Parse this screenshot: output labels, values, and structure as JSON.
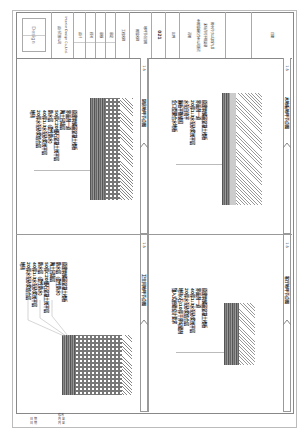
{
  "title_block": {
    "logo_text": "Design",
    "company_lines": [
      "设计有限公司",
      "Interior Design Co.,Ltd."
    ],
    "project_label": "工程名称",
    "drawing_label": "图纸名称",
    "drawing_name": "地坪节点详图",
    "drawing_no_label": "图纸编号",
    "drawing_no": "021",
    "scale_label": "比例",
    "notes_label": "说明",
    "notes": [
      "本图纸版权归本公司所有",
      "未经许可不得复制",
      "图中尺寸以现场为准"
    ],
    "approvals": [
      "设计",
      "校对",
      "审核",
      "审定"
    ],
    "date_label": "日期"
  },
  "panels": [
    {
      "id": "kitchen",
      "title": "厨房地坪节点图",
      "scale": "1:5",
      "callouts": [
        "地砖",
        "20厚水泥砂浆结合层",
        "40厚1:3水泥砂浆找平层",
        "防水层（柔性防水）",
        "50厚C20细石混凝土找平层",
        "陶土回填层",
        "界面剂一道",
        "原建筑钢筋混凝土楼板"
      ]
    },
    {
      "id": "wood-floor",
      "title": "木地板地坪节点图",
      "scale": "1:5",
      "callouts": [
        "企口型聚合水地板",
        "隔板平衡锁扣",
        "水泥自流平",
        "20厚1:3水泥砂浆找平层",
        "界面剂一道",
        "原建筑钢筋混凝土楼板"
      ]
    },
    {
      "id": "bathroom",
      "title": "卫生间地坪节点图",
      "scale": "1:5",
      "callouts": [
        "地砖",
        "20厚水泥砂浆结合层",
        "40厚1:3水泥砂浆找平层",
        "防水层（柔性防水）",
        "50厚C20细石混凝土找平层",
        "陶土回填层",
        "防水层（柔性防水）",
        "原建筑钢筋混凝土楼板"
      ]
    },
    {
      "id": "living-room",
      "title": "客厅地坪节点图",
      "scale": "1:5",
      "callouts": [
        "镶入式嵌缝设计要求",
        "地砖(石)10厚干拌勾缝剂",
        "20厚水泥砂浆结合层",
        "40厚1:3水泥砂浆找平层",
        "界面剂一道",
        "原建筑钢筋混凝土楼板"
      ]
    }
  ],
  "revision_table": {
    "header": "修改",
    "rows": [
      [
        "日 期",
        "内 容"
      ],
      [
        "日 期",
        "内 容"
      ]
    ]
  }
}
